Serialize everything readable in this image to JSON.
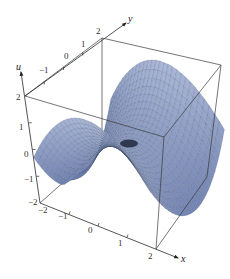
{
  "chart_data": {
    "type": "surface3d",
    "title": "",
    "function_hint": "saddle-like surface u(x,y) with ridges rising along back/left and dipping front; radial mesh lines",
    "xlabel": "x",
    "ylabel": "y",
    "zlabel": "u",
    "xlim": [
      -2,
      2
    ],
    "ylim": [
      -2,
      2
    ],
    "zlim": [
      -2,
      2
    ],
    "x_ticks": [
      "-2",
      "-1",
      "0",
      "1",
      "2"
    ],
    "y_ticks": [
      "-1",
      "0",
      "1",
      "2"
    ],
    "z_ticks": [
      "-2",
      "-1",
      "0",
      "1",
      "2"
    ],
    "box": true,
    "grid": false,
    "surface_color": "#8fa3c8",
    "surface_shadow_color": "#3a5fb0",
    "mesh_color": "#2b3550"
  },
  "axes": {
    "x_label": "x",
    "y_label": "y",
    "u_label": "u",
    "x_tick_labels": [
      {
        "text": "−2",
        "x": 38,
        "y": 213
      },
      {
        "text": "−1",
        "x": 58,
        "y": 219
      },
      {
        "text": "0",
        "x": 88,
        "y": 233
      },
      {
        "text": "1",
        "x": 118,
        "y": 246
      },
      {
        "text": "2",
        "x": 148,
        "y": 259
      }
    ],
    "y_tick_labels": [
      {
        "text": "−1",
        "x": 39,
        "y": 73
      },
      {
        "text": "0",
        "x": 64,
        "y": 59
      },
      {
        "text": "1",
        "x": 81,
        "y": 47
      },
      {
        "text": "2",
        "x": 96,
        "y": 34
      }
    ],
    "u_tick_labels": [
      {
        "text": "2",
        "x": 16,
        "y": 100
      },
      {
        "text": "1",
        "x": 19,
        "y": 130
      },
      {
        "text": "0",
        "x": 24,
        "y": 157
      },
      {
        "text": "−1",
        "x": 24,
        "y": 182
      },
      {
        "text": "−2",
        "x": 28,
        "y": 205
      }
    ]
  }
}
